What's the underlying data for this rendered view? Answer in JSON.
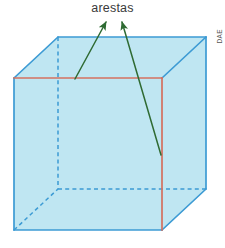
{
  "figure": {
    "title": "arestas",
    "credit": "DAE",
    "colors": {
      "face_fill": "#bfe6f2",
      "visible_edge": "#3d9bd4",
      "hidden_edge": "#3d9bd4",
      "highlight_edge": "#d4705f",
      "arrow": "#2f6b33",
      "label_text": "#3a3a3a",
      "background": "#ffffff"
    },
    "cube": {
      "front_face": [
        [
          14,
          78
        ],
        [
          162,
          78
        ],
        [
          162,
          230
        ],
        [
          14,
          230
        ]
      ],
      "back_face": [
        [
          58,
          37
        ],
        [
          206,
          37
        ],
        [
          206,
          189
        ],
        [
          58,
          189
        ]
      ],
      "highlighted_edges": [
        {
          "name": "front-top-edge",
          "from": [
            14,
            78
          ],
          "to": [
            162,
            78
          ]
        },
        {
          "name": "front-right-vertical-edge",
          "from": [
            162,
            78
          ],
          "to": [
            162,
            230
          ]
        }
      ],
      "hidden_edges": [
        {
          "name": "back-left-vertical-edge",
          "from": [
            58,
            37
          ],
          "to": [
            58,
            189
          ]
        },
        {
          "name": "back-bottom-edge",
          "from": [
            58,
            189
          ],
          "to": [
            206,
            189
          ]
        },
        {
          "name": "back-left-diagonal-edge",
          "from": [
            14,
            230
          ],
          "to": [
            58,
            189
          ]
        }
      ]
    },
    "arrows": [
      {
        "name": "arrow-to-top-edge",
        "tail": [
          75,
          79
        ],
        "head": [
          106,
          22
        ]
      },
      {
        "name": "arrow-to-right-edge",
        "tail": [
          161,
          155
        ],
        "head": [
          122,
          22
        ]
      }
    ]
  }
}
